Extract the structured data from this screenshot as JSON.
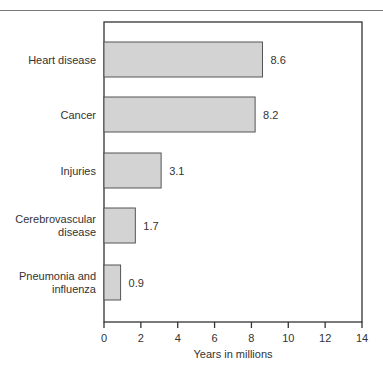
{
  "chart_data": {
    "type": "bar",
    "orientation": "horizontal",
    "title": "",
    "xlabel": "Years in millions",
    "ylabel": "",
    "categories": [
      "Heart disease",
      "Cancer",
      "Injuries",
      "Cerebrovascular disease",
      "Pneumonia and influenza"
    ],
    "category_lines": [
      [
        "Heart disease"
      ],
      [
        "Cancer"
      ],
      [
        "Injuries"
      ],
      [
        "Cerebrovascular",
        "disease"
      ],
      [
        "Pneumonia and",
        "influenza"
      ]
    ],
    "values": [
      8.6,
      8.2,
      3.1,
      1.7,
      0.9
    ],
    "value_labels": [
      "8.6",
      "8.2",
      "3.1",
      "1.7",
      "0.9"
    ],
    "xlim": [
      0,
      14
    ],
    "xticks": [
      0,
      2,
      4,
      6,
      8,
      10,
      12,
      14
    ],
    "grid": false,
    "legend": null,
    "bar_color": "#d3d3d3",
    "bar_edge_color": "#555555"
  }
}
